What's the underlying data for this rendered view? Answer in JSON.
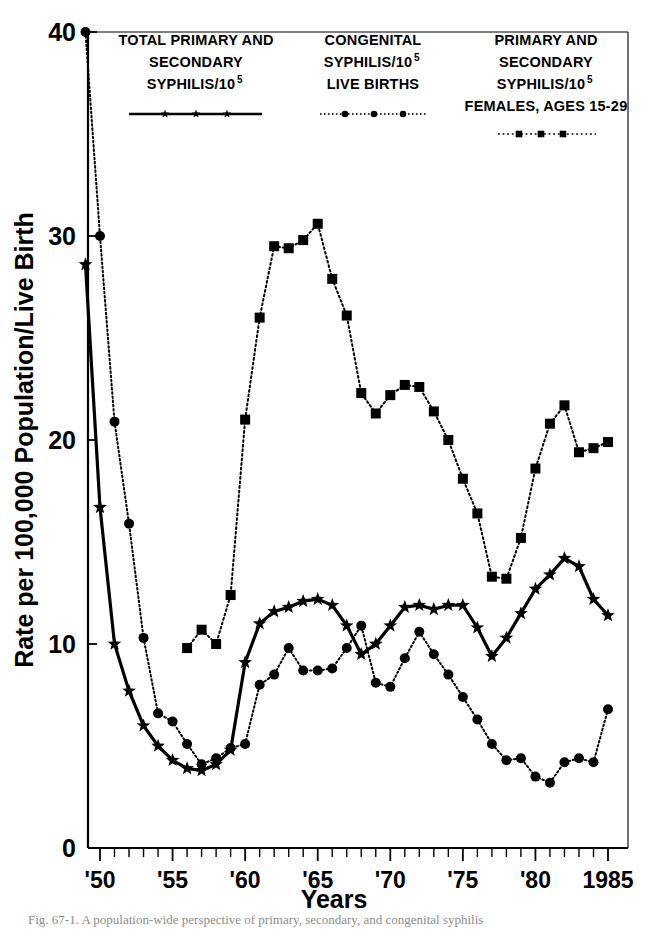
{
  "figure": {
    "caption": "Fig. 67-1.   A population-wide perspective of primary, secondary, and congenital syphilis",
    "background_color": "#ffffff",
    "ink_color": "#000000"
  },
  "axes": {
    "ylabel": "Rate per 100,000 Population/Live Birth",
    "xlabel": "Years",
    "ytick_labels": [
      "0",
      "10",
      "20",
      "30",
      "40"
    ],
    "ytick_values": [
      0,
      10,
      20,
      30,
      40
    ],
    "xtick_labels": [
      "'50",
      "'55",
      "'60",
      "'65",
      "'70",
      "'75",
      "'80",
      "1985"
    ],
    "xtick_values": [
      1950,
      1955,
      1960,
      1965,
      1970,
      1975,
      1980,
      1985
    ],
    "xlim": [
      1949,
      1985.6
    ],
    "ylim": [
      0,
      40
    ],
    "grid": "off",
    "frame": "box"
  },
  "legend": {
    "position": "top-inside",
    "entries": [
      {
        "id": "total-ps-syphilis",
        "lines": [
          "TOTAL PRIMARY AND",
          "SECONDARY",
          "SYPHILIS/10"
        ],
        "superscript": "5",
        "marker": "star",
        "linestyle": "solid",
        "color": "#000000"
      },
      {
        "id": "congenital-syphilis",
        "lines": [
          "CONGENITAL",
          "SYPHILIS/10",
          "LIVE BIRTHS"
        ],
        "superscript": "5",
        "superscript_on_line": 1,
        "marker": "circle",
        "linestyle": "dotted",
        "color": "#000000"
      },
      {
        "id": "ps-syphilis-females-15-29",
        "lines": [
          "PRIMARY AND",
          "SECONDARY",
          "SYPHILIS/10",
          "FEMALES, AGES 15-29"
        ],
        "superscript": "5",
        "superscript_on_line": 2,
        "marker": "square",
        "linestyle": "dash-dot",
        "color": "#000000"
      }
    ]
  },
  "chart_data": {
    "type": "line",
    "title": "",
    "xlabel": "Years",
    "ylabel": "Rate per 100,000 Population/Live Birth",
    "xlim": [
      1949,
      1985.6
    ],
    "ylim": [
      0,
      40
    ],
    "grid": false,
    "legend_position": "top-inside",
    "series": [
      {
        "name": "TOTAL PRIMARY AND SECONDARY SYPHILIS/10^5",
        "marker": "star",
        "linestyle": "solid",
        "x": [
          1949,
          1950,
          1951,
          1952,
          1953,
          1954,
          1955,
          1956,
          1957,
          1958,
          1959,
          1960,
          1961,
          1962,
          1963,
          1964,
          1965,
          1966,
          1967,
          1968,
          1969,
          1970,
          1971,
          1972,
          1973,
          1974,
          1975,
          1976,
          1977,
          1978,
          1979,
          1980,
          1981,
          1982,
          1983,
          1984,
          1985
        ],
        "y": [
          28.6,
          16.7,
          10.0,
          7.7,
          6.0,
          5.0,
          4.3,
          3.9,
          3.8,
          4.1,
          4.8,
          9.1,
          11.0,
          11.6,
          11.8,
          12.1,
          12.2,
          11.9,
          10.9,
          9.5,
          10.0,
          10.9,
          11.8,
          11.9,
          11.7,
          11.9,
          11.9,
          10.8,
          9.4,
          10.3,
          11.5,
          12.7,
          13.4,
          14.2,
          13.8,
          12.2,
          11.4
        ]
      },
      {
        "name": "CONGENITAL SYPHILIS/10^5 LIVE BIRTHS",
        "marker": "circle",
        "linestyle": "dotted",
        "x": [
          1949,
          1950,
          1951,
          1952,
          1953,
          1954,
          1955,
          1956,
          1957,
          1958,
          1959,
          1960,
          1961,
          1962,
          1963,
          1964,
          1965,
          1966,
          1967,
          1968,
          1969,
          1970,
          1971,
          1972,
          1973,
          1974,
          1975,
          1976,
          1977,
          1978,
          1979,
          1980,
          1981,
          1982,
          1983,
          1984,
          1985
        ],
        "y": [
          40.0,
          30.0,
          20.9,
          15.9,
          10.3,
          6.6,
          6.2,
          5.1,
          4.1,
          4.4,
          4.9,
          5.1,
          8.0,
          8.5,
          9.8,
          8.7,
          8.7,
          8.8,
          9.8,
          10.9,
          8.1,
          7.9,
          9.3,
          10.6,
          9.5,
          8.5,
          7.4,
          6.3,
          5.1,
          4.3,
          4.4,
          3.5,
          3.2,
          4.2,
          4.4,
          4.2,
          6.8
        ]
      },
      {
        "name": "PRIMARY AND SECONDARY SYPHILIS/10^5 FEMALES, AGES 15-29",
        "marker": "square",
        "linestyle": "dash-dot",
        "x": [
          1956,
          1957,
          1958,
          1959,
          1960,
          1961,
          1962,
          1963,
          1964,
          1965,
          1966,
          1967,
          1968,
          1969,
          1970,
          1971,
          1972,
          1973,
          1974,
          1975,
          1976,
          1977,
          1978,
          1979,
          1980,
          1981,
          1982,
          1983,
          1984,
          1985
        ],
        "y": [
          9.8,
          10.7,
          10.0,
          12.4,
          21.0,
          26.0,
          29.5,
          29.4,
          29.8,
          30.6,
          27.9,
          26.1,
          22.3,
          21.3,
          22.2,
          22.7,
          22.6,
          21.4,
          20.0,
          18.1,
          16.4,
          13.3,
          13.2,
          15.2,
          18.6,
          20.8,
          21.7,
          19.4,
          19.6,
          19.9
        ]
      }
    ]
  }
}
